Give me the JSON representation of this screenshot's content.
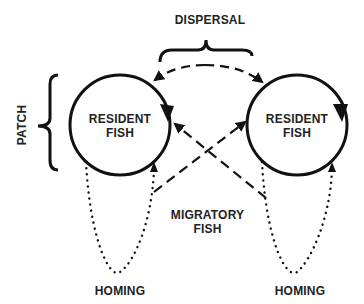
{
  "diagram": {
    "labels": {
      "dispersal": "DISPERSAL",
      "patch": "PATCH",
      "resident_left_line1": "RESIDENT",
      "resident_left_line2": "FISH",
      "resident_right_line1": "RESIDENT",
      "resident_right_line2": "FISH",
      "migratory_line1": "MIGRATORY",
      "migratory_line2": "FISH",
      "homing_left": "HOMING",
      "homing_right": "HOMING"
    },
    "colors": {
      "stroke": "#111111",
      "background": "#ffffff"
    }
  }
}
